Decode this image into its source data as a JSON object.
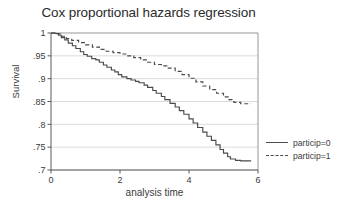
{
  "chart_data": {
    "type": "line",
    "title": "Cox proportional hazards regression",
    "xlabel": "analysis time",
    "ylabel": "Survival",
    "xlim": [
      0,
      6
    ],
    "ylim": [
      0.7,
      1.0
    ],
    "xticks": [
      "0",
      "2",
      "4",
      "6"
    ],
    "xtick_values": [
      0,
      2,
      4,
      6
    ],
    "yticks": [
      "1",
      ".95",
      ".9",
      ".85",
      ".8",
      ".75",
      ".7"
    ],
    "ytick_values": [
      1,
      0.95,
      0.9,
      0.85,
      0.8,
      0.75,
      0.7
    ],
    "grid": "horizontal",
    "legend_position": "right-outside",
    "series": [
      {
        "name": "particip=0",
        "style": "solid",
        "color": "#4a4a4a",
        "x": [
          0,
          0.12,
          0.22,
          0.3,
          0.4,
          0.5,
          0.62,
          0.72,
          0.85,
          0.95,
          1.05,
          1.18,
          1.3,
          1.4,
          1.52,
          1.62,
          1.75,
          1.85,
          1.95,
          2.05,
          2.2,
          2.32,
          2.45,
          2.55,
          2.7,
          2.8,
          2.95,
          3.05,
          3.2,
          3.3,
          3.45,
          3.6,
          3.72,
          3.85,
          4.0,
          4.12,
          4.25,
          4.4,
          4.52,
          4.65,
          4.78,
          4.9,
          5.0,
          5.12,
          5.2,
          5.35,
          5.5,
          5.65,
          5.8
        ],
        "y": [
          1.0,
          0.999,
          0.995,
          0.99,
          0.985,
          0.978,
          0.972,
          0.966,
          0.959,
          0.953,
          0.949,
          0.944,
          0.941,
          0.936,
          0.93,
          0.925,
          0.919,
          0.915,
          0.909,
          0.904,
          0.9,
          0.897,
          0.894,
          0.891,
          0.886,
          0.881,
          0.874,
          0.868,
          0.861,
          0.854,
          0.846,
          0.838,
          0.83,
          0.822,
          0.812,
          0.803,
          0.793,
          0.783,
          0.774,
          0.765,
          0.755,
          0.745,
          0.737,
          0.729,
          0.724,
          0.721,
          0.72,
          0.72,
          0.72
        ]
      },
      {
        "name": "particip=1",
        "style": "dashed",
        "color": "#4a4a4a",
        "x": [
          0,
          0.15,
          0.3,
          0.45,
          0.6,
          0.8,
          1.0,
          1.2,
          1.4,
          1.6,
          1.8,
          2.0,
          2.2,
          2.4,
          2.6,
          2.8,
          3.0,
          3.2,
          3.4,
          3.6,
          3.8,
          4.0,
          4.2,
          4.4,
          4.6,
          4.8,
          5.0,
          5.15,
          5.3,
          5.5,
          5.7,
          5.8
        ],
        "y": [
          1.0,
          0.998,
          0.993,
          0.988,
          0.984,
          0.979,
          0.974,
          0.969,
          0.964,
          0.96,
          0.957,
          0.954,
          0.95,
          0.946,
          0.941,
          0.936,
          0.931,
          0.928,
          0.923,
          0.916,
          0.909,
          0.901,
          0.893,
          0.884,
          0.876,
          0.868,
          0.86,
          0.854,
          0.848,
          0.845,
          0.845,
          0.845
        ]
      }
    ]
  }
}
